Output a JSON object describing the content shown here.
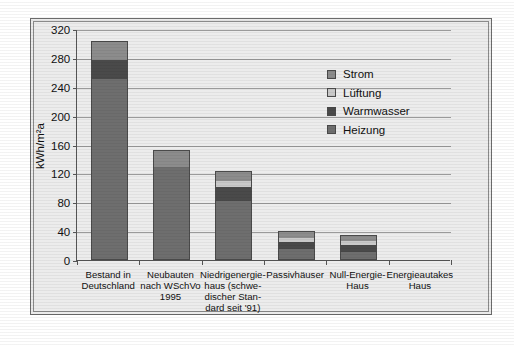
{
  "chart_data": {
    "type": "bar",
    "stacked": true,
    "title": "",
    "xlabel": "",
    "ylabel": "kWh/m²a",
    "ylim": [
      0,
      320
    ],
    "ytick_step": 40,
    "yticks": [
      0,
      40,
      80,
      120,
      160,
      200,
      240,
      280,
      320
    ],
    "grid": true,
    "legend_position": "top-right-inside",
    "categories": [
      "Bestand in Deutschland",
      "Neubauten nach WSchVo 1995",
      "Niedrigenergie-haus (schwe-discher Stan-dard seit '91)",
      "Passivhäuser",
      "Null-Energie-Haus",
      "Energieautakes Haus"
    ],
    "category_lines": [
      [
        "Bestand in",
        "Deutschland"
      ],
      [
        "Neubauten",
        "nach WSchVo",
        "1995"
      ],
      [
        "Niedrigenergie-",
        "haus (schwe-",
        "discher Stan-",
        "dard seit '91)"
      ],
      [
        "Passivhäuser"
      ],
      [
        "Null-Energie-",
        "Haus"
      ],
      [
        "Energieautakes",
        "Haus"
      ]
    ],
    "series": [
      {
        "name": "Heizung",
        "color": "#6e6e6e",
        "values": [
          250,
          128,
          80,
          14,
          10,
          0
        ]
      },
      {
        "name": "Warmwasser",
        "color": "#4a4a4a",
        "values": [
          25,
          0,
          20,
          9,
          9,
          0
        ]
      },
      {
        "name": "Lüftung",
        "color": "#c9c9c9",
        "values": [
          0,
          0,
          8,
          6,
          6,
          0
        ]
      },
      {
        "name": "Strom",
        "color": "#8c8c8c",
        "values": [
          25,
          22,
          12,
          9,
          7,
          0
        ]
      }
    ],
    "totals": [
      300,
      150,
      120,
      38,
      32,
      0
    ]
  },
  "legend": {
    "items": [
      {
        "label": "Strom",
        "color": "#8c8c8c"
      },
      {
        "label": "Lüftung",
        "color": "#c9c9c9"
      },
      {
        "label": "Warmwasser",
        "color": "#4a4a4a"
      },
      {
        "label": "Heizung",
        "color": "#6e6e6e"
      }
    ]
  },
  "colors": {
    "background": "#ececec",
    "frame": "#6b6b6b",
    "axis": "#555555",
    "grid": "#9a9a9a",
    "text": "#111111"
  }
}
